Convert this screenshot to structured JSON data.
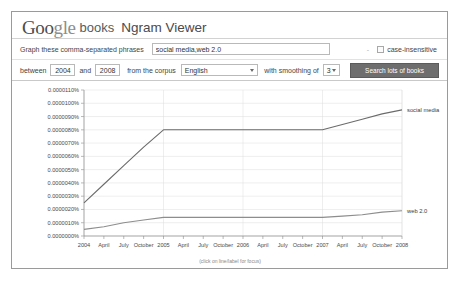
{
  "header": {
    "logo_google_part1": "Goo",
    "logo_google_part2": "gle",
    "logo_books": "books",
    "product_title": "Ngram Viewer"
  },
  "query": {
    "phrases_label": "Graph these comma-separated phrases",
    "phrases_value": "social media,web 2.0",
    "phrases_placeholder": "",
    "separator_dash": "-",
    "case_insensitive_label": "case-insensitive",
    "case_insensitive_checked": false
  },
  "options": {
    "between_label": "between",
    "start_year": "2004",
    "and_label": "and",
    "end_year": "2008",
    "corpus_label": "from the corpus",
    "corpus_value": "English",
    "smoothing_label": "with smoothing of",
    "smoothing_value": "3",
    "search_button": "Search lots of books"
  },
  "chart_data": {
    "type": "line",
    "title": "",
    "xlabel": "",
    "ylabel": "",
    "grid": true,
    "legend_position": "right-inline",
    "annotation": "(click on line/label for focus)",
    "ylim": [
      0.0,
      1.1e-05
    ],
    "ytick_labels": [
      "0.0000110%",
      "0.0000100%",
      "0.0000090%",
      "0.0000080%",
      "0.0000070%",
      "0.0000060%",
      "0.0000050%",
      "0.0000040%",
      "0.0000030%",
      "0.0000020%",
      "0.0000010%",
      "0.0000000%"
    ],
    "ytick_values": [
      1.1e-05,
      1e-05,
      9e-06,
      8e-06,
      7e-06,
      6e-06,
      5e-06,
      4e-06,
      3e-06,
      2e-06,
      1e-06,
      0.0
    ],
    "xtick_labels": [
      "2004",
      "April",
      "July",
      "October",
      "2005",
      "April",
      "July",
      "October",
      "2006",
      "April",
      "July",
      "October",
      "2007",
      "April",
      "July",
      "October",
      "2008"
    ],
    "x": [
      2004.0,
      2004.25,
      2004.5,
      2004.75,
      2005.0,
      2005.25,
      2005.5,
      2005.75,
      2006.0,
      2006.25,
      2006.5,
      2006.75,
      2007.0,
      2007.25,
      2007.5,
      2007.75,
      2008.0
    ],
    "series": [
      {
        "name": "social media",
        "color": "#6b6b6b",
        "values": [
          2.5e-06,
          3.9e-06,
          5.3e-06,
          6.7e-06,
          8e-06,
          8e-06,
          8e-06,
          8e-06,
          8e-06,
          8e-06,
          8e-06,
          8e-06,
          8e-06,
          8.4e-06,
          8.8e-06,
          9.2e-06,
          9.5e-06
        ]
      },
      {
        "name": "web 2.0",
        "color": "#8d8d8d",
        "values": [
          5e-07,
          7e-07,
          1e-06,
          1.2e-06,
          1.4e-06,
          1.4e-06,
          1.4e-06,
          1.4e-06,
          1.4e-06,
          1.4e-06,
          1.4e-06,
          1.4e-06,
          1.4e-06,
          1.5e-06,
          1.6e-06,
          1.8e-06,
          1.9e-06
        ]
      }
    ]
  }
}
